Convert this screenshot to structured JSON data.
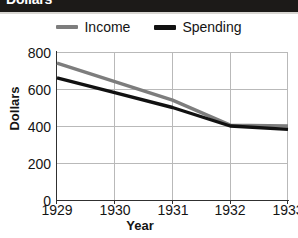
{
  "banner": {
    "title": "Dollars",
    "visible": "cropped"
  },
  "legend": {
    "position": "top-center",
    "entries": [
      {
        "label": "Income",
        "color": "#7d7d7d"
      },
      {
        "label": "Spending",
        "color": "#111111"
      }
    ]
  },
  "axes": {
    "ylabel": "Dollars",
    "xlabel": "Year",
    "yticks": [
      "800",
      "600",
      "400",
      "200",
      "0"
    ],
    "xticks": [
      "1929",
      "1930",
      "1931",
      "1932",
      "1933"
    ]
  },
  "chart_data": {
    "type": "line",
    "title": "Dollars",
    "xlabel": "Year",
    "ylabel": "Dollars",
    "x": [
      1929,
      1930,
      1931,
      1932,
      1933
    ],
    "categories": [
      "1929",
      "1930",
      "1931",
      "1932",
      "1933"
    ],
    "series": [
      {
        "name": "Income",
        "color": "#7d7d7d",
        "values": [
          740,
          640,
          540,
          405,
          400
        ]
      },
      {
        "name": "Spending",
        "color": "#111111",
        "values": [
          660,
          580,
          500,
          400,
          382
        ]
      }
    ],
    "xlim": [
      1929,
      1933
    ],
    "ylim": [
      0,
      800
    ],
    "ytick_values": [
      800,
      600,
      400,
      200,
      0
    ],
    "grid": true,
    "legend_position": "top-center"
  }
}
